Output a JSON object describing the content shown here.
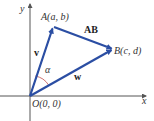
{
  "diagram": {
    "type": "vector-diagram",
    "axes": {
      "x_label": "x",
      "y_label": "y",
      "origin_label": "O(0, 0)"
    },
    "points": {
      "A": {
        "label": "A(a, b)"
      },
      "B": {
        "label": "B(c, d)"
      }
    },
    "vectors": [
      {
        "name": "v",
        "label": "v",
        "from": "O",
        "to": "A"
      },
      {
        "name": "w",
        "label": "w",
        "from": "O",
        "to": "B"
      },
      {
        "name": "AB",
        "label": "AB",
        "from": "A",
        "to": "B"
      }
    ],
    "angle": {
      "label": "α",
      "between": [
        "v",
        "w"
      ]
    },
    "colors": {
      "vector": "#2b4ea3",
      "axis": "#555555",
      "angle_arc": "#c0504d"
    }
  }
}
